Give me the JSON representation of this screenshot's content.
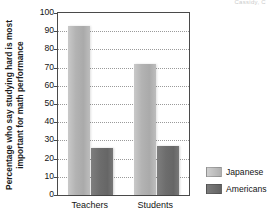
{
  "header_fragment": "Cassidy, C",
  "legend": {
    "position": "right",
    "items": [
      {
        "label": "Japanese",
        "color": "#b3b3b3",
        "swatch": "light"
      },
      {
        "label": "Americans",
        "color": "#6d6d6d",
        "swatch": "dark"
      }
    ]
  },
  "axis": {
    "ylabel_line1": "Percentage who say studying hard is most",
    "ylabel_line2": "important for math performance",
    "yticks": [
      0,
      10,
      20,
      30,
      40,
      50,
      60,
      70,
      80,
      90,
      100
    ],
    "xticks": [
      "Teachers",
      "Students"
    ]
  },
  "chart_data": {
    "type": "bar",
    "title": "",
    "subtitle": "",
    "xlabel": "",
    "ylabel": "Percentage who say studying hard is most important for math performance",
    "categories": [
      "Teachers",
      "Students"
    ],
    "series": [
      {
        "name": "Japanese",
        "color": "#b3b3b3",
        "values": [
          93,
          72
        ]
      },
      {
        "name": "Americans",
        "color": "#6d6d6d",
        "values": [
          26,
          27
        ]
      }
    ],
    "ylim": [
      0,
      100
    ],
    "ytick_step": 10,
    "grid": true,
    "grid_axis": "y",
    "grid_style": "dotted",
    "legend_position": "right",
    "annotations": []
  }
}
